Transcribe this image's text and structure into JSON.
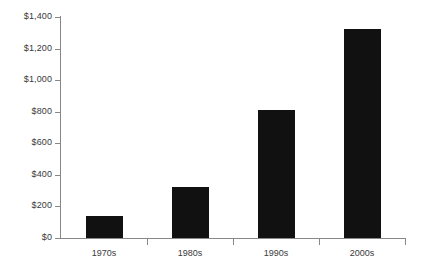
{
  "chart_data": {
    "type": "bar",
    "title": "",
    "subtitle": "",
    "xlabel": "",
    "ylabel": "",
    "categories": [
      "1970s",
      "1980s",
      "1990s",
      "2000s"
    ],
    "values": [
      140,
      325,
      810,
      1325
    ],
    "ylim": [
      0,
      1400
    ],
    "y_ticks": [
      0,
      200,
      400,
      600,
      800,
      1000,
      1200,
      1400
    ],
    "y_tick_labels": [
      "$0",
      "$200",
      "$400",
      "$600",
      "$800",
      "$1,000",
      "$1,200",
      "$1,400"
    ],
    "grid": false,
    "legend": false,
    "legend_position": "none",
    "value_prefix": "$",
    "series": [
      {
        "name": "",
        "values": [
          140,
          325,
          810,
          1325
        ]
      }
    ]
  },
  "style": {
    "bar_color": "#111111",
    "axis_color": "#888888",
    "text_color": "#3a3a3a",
    "background": "#ffffff"
  }
}
